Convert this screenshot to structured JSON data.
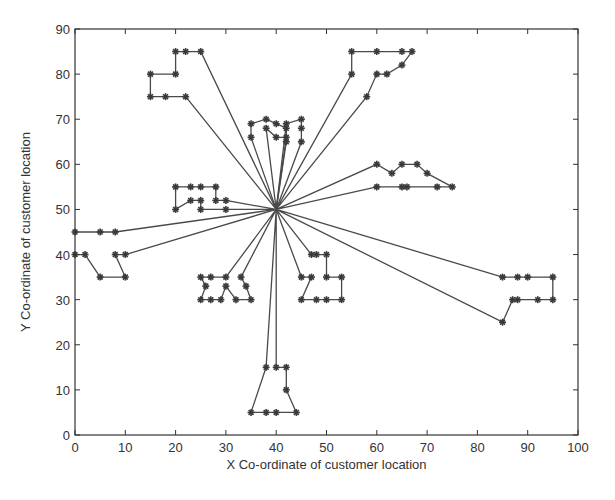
{
  "chart_data": {
    "type": "line",
    "title": "",
    "xlabel": "X Co-ordinate of customer location",
    "ylabel": "Y Co-ordinate of customer location",
    "xlim": [
      0,
      100
    ],
    "ylim": [
      0,
      90
    ],
    "xticks": [
      0,
      10,
      20,
      30,
      40,
      50,
      60,
      70,
      80,
      90,
      100
    ],
    "yticks": [
      0,
      10,
      20,
      30,
      40,
      50,
      60,
      70,
      80,
      90
    ],
    "grid": false,
    "legend": null,
    "marker": "asterisk",
    "depot": [
      40,
      50
    ],
    "series": [
      {
        "name": "route-1",
        "points": [
          [
            40,
            50
          ],
          [
            25,
            85
          ],
          [
            22,
            85
          ],
          [
            20,
            85
          ],
          [
            20,
            80
          ],
          [
            15,
            80
          ],
          [
            15,
            75
          ],
          [
            18,
            75
          ],
          [
            22,
            75
          ],
          [
            40,
            50
          ]
        ]
      },
      {
        "name": "route-2",
        "points": [
          [
            40,
            50
          ],
          [
            35,
            66
          ],
          [
            35,
            69
          ],
          [
            38,
            70
          ],
          [
            40,
            69
          ],
          [
            42,
            68
          ],
          [
            42,
            65
          ],
          [
            40,
            50
          ]
        ]
      },
      {
        "name": "route-3",
        "points": [
          [
            40,
            50
          ],
          [
            38,
            68
          ],
          [
            40,
            66
          ],
          [
            42,
            66
          ],
          [
            40,
            50
          ]
        ]
      },
      {
        "name": "route-4",
        "points": [
          [
            40,
            50
          ],
          [
            45,
            65
          ],
          [
            45,
            68
          ],
          [
            45,
            70
          ],
          [
            42,
            69
          ],
          [
            40,
            50
          ]
        ]
      },
      {
        "name": "route-5",
        "points": [
          [
            40,
            50
          ],
          [
            55,
            80
          ],
          [
            55,
            85
          ],
          [
            60,
            85
          ],
          [
            65,
            85
          ],
          [
            67,
            85
          ],
          [
            65,
            82
          ],
          [
            62,
            80
          ],
          [
            60,
            80
          ],
          [
            58,
            75
          ],
          [
            40,
            50
          ]
        ]
      },
      {
        "name": "route-6",
        "points": [
          [
            40,
            50
          ],
          [
            60,
            60
          ],
          [
            63,
            58
          ],
          [
            65,
            60
          ],
          [
            68,
            60
          ],
          [
            70,
            58
          ],
          [
            75,
            55
          ],
          [
            72,
            55
          ],
          [
            66,
            55
          ],
          [
            65,
            55
          ],
          [
            60,
            55
          ],
          [
            40,
            50
          ]
        ]
      },
      {
        "name": "route-7",
        "points": [
          [
            40,
            50
          ],
          [
            30,
            52
          ],
          [
            28,
            52
          ],
          [
            28,
            55
          ],
          [
            25,
            55
          ],
          [
            23,
            55
          ],
          [
            20,
            55
          ],
          [
            20,
            50
          ],
          [
            23,
            52
          ],
          [
            25,
            52
          ],
          [
            25,
            50
          ],
          [
            30,
            50
          ],
          [
            40,
            50
          ]
        ]
      },
      {
        "name": "route-8",
        "points": [
          [
            40,
            50
          ],
          [
            8,
            45
          ],
          [
            5,
            45
          ],
          [
            0,
            45
          ]
        ]
      },
      {
        "name": "route-9",
        "points": [
          [
            40,
            50
          ],
          [
            10,
            40
          ],
          [
            8,
            40
          ],
          [
            10,
            35
          ],
          [
            5,
            35
          ],
          [
            2,
            40
          ],
          [
            0,
            40
          ]
        ]
      },
      {
        "name": "route-10",
        "points": [
          [
            40,
            50
          ],
          [
            30,
            35
          ],
          [
            27,
            35
          ],
          [
            25,
            35
          ],
          [
            26,
            33
          ],
          [
            25,
            30
          ],
          [
            27,
            30
          ],
          [
            29,
            30
          ],
          [
            30,
            33
          ],
          [
            32,
            30
          ],
          [
            35,
            30
          ],
          [
            34,
            33
          ],
          [
            33,
            35
          ],
          [
            40,
            50
          ]
        ]
      },
      {
        "name": "route-11",
        "points": [
          [
            40,
            50
          ],
          [
            47,
            40
          ],
          [
            48,
            40
          ],
          [
            50,
            40
          ],
          [
            50,
            35
          ],
          [
            53,
            35
          ],
          [
            53,
            30
          ],
          [
            50,
            30
          ],
          [
            48,
            30
          ],
          [
            45,
            30
          ],
          [
            47,
            35
          ],
          [
            45,
            35
          ],
          [
            40,
            50
          ]
        ]
      },
      {
        "name": "route-12",
        "points": [
          [
            40,
            50
          ],
          [
            85,
            35
          ],
          [
            88,
            35
          ],
          [
            90,
            35
          ],
          [
            95,
            35
          ],
          [
            95,
            30
          ],
          [
            92,
            30
          ],
          [
            88,
            30
          ],
          [
            87,
            30
          ],
          [
            85,
            25
          ],
          [
            40,
            50
          ]
        ]
      },
      {
        "name": "route-13",
        "points": [
          [
            40,
            50
          ],
          [
            38,
            15
          ],
          [
            35,
            5
          ],
          [
            38,
            5
          ],
          [
            40,
            5
          ],
          [
            44,
            5
          ],
          [
            42,
            10
          ],
          [
            42,
            15
          ],
          [
            40,
            15
          ],
          [
            40,
            50
          ]
        ]
      }
    ]
  }
}
